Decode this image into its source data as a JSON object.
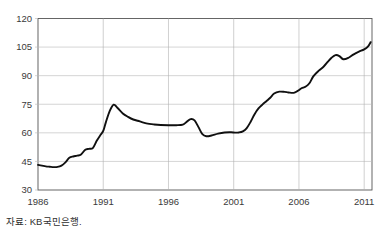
{
  "source_note": "자료: KB국민은행.",
  "chart_data": {
    "type": "line",
    "title": "",
    "subtitle": "",
    "xlabel": "",
    "ylabel": "",
    "xlim": [
      1986,
      2011.6
    ],
    "ylim": [
      30,
      120
    ],
    "grid": true,
    "legend": false,
    "legend_position": "none",
    "line_color": "#101010",
    "grid_color": "#b9b9b9",
    "frame_color": "#555555",
    "xticks": [
      1986,
      1991,
      1996,
      2001,
      2006,
      2011
    ],
    "xtick_labels": [
      "1986",
      "1991",
      "1996",
      "2001",
      "2006",
      "2011"
    ],
    "yticks": [
      30,
      45,
      60,
      75,
      90,
      105,
      120
    ],
    "ytick_labels": [
      "30",
      "45",
      "60",
      "75",
      "90",
      "105",
      "120"
    ],
    "series": [
      {
        "name": "주택매매가격지수",
        "x": [
          1986.0,
          1986.3,
          1986.6,
          1986.9,
          1987.2,
          1987.5,
          1987.8,
          1988.1,
          1988.4,
          1988.7,
          1989.0,
          1989.3,
          1989.6,
          1989.9,
          1990.2,
          1990.5,
          1990.8,
          1991.0,
          1991.2,
          1991.5,
          1991.8,
          1992.1,
          1992.5,
          1992.9,
          1993.3,
          1993.8,
          1994.3,
          1994.9,
          1995.4,
          1996.0,
          1996.6,
          1997.1,
          1997.4,
          1997.7,
          1998.0,
          1998.3,
          1998.6,
          1998.9,
          1999.3,
          1999.8,
          2000.3,
          2000.8,
          2001.1,
          2001.4,
          2001.7,
          2002.0,
          2002.3,
          2002.6,
          2002.9,
          2003.2,
          2003.5,
          2003.8,
          2004.1,
          2004.5,
          2004.9,
          2005.2,
          2005.6,
          2005.9,
          2006.2,
          2006.5,
          2006.8,
          2007.1,
          2007.5,
          2007.9,
          2008.2,
          2008.5,
          2008.8,
          2009.1,
          2009.4,
          2009.8,
          2010.2,
          2010.6,
          2011.0,
          2011.3,
          2011.5
        ],
        "values": [
          43.2,
          42.8,
          42.4,
          42.2,
          42.0,
          42.1,
          42.8,
          44.5,
          46.9,
          47.6,
          48.0,
          48.6,
          51.0,
          51.6,
          52.0,
          55.8,
          59.0,
          61.0,
          65.5,
          71.5,
          74.8,
          73.0,
          70.2,
          68.4,
          67.0,
          66.0,
          65.0,
          64.4,
          64.1,
          64.0,
          64.0,
          64.3,
          65.8,
          67.2,
          66.5,
          63.0,
          59.3,
          58.2,
          58.6,
          59.6,
          60.2,
          60.3,
          60.1,
          60.2,
          60.8,
          62.5,
          65.8,
          69.8,
          72.8,
          74.8,
          76.6,
          78.4,
          80.6,
          81.6,
          81.5,
          81.2,
          81.0,
          82.0,
          83.4,
          84.2,
          86.0,
          89.6,
          92.5,
          94.8,
          97.2,
          99.4,
          100.8,
          100.3,
          98.6,
          99.4,
          101.2,
          102.6,
          103.8,
          105.4,
          107.6
        ]
      }
    ]
  }
}
